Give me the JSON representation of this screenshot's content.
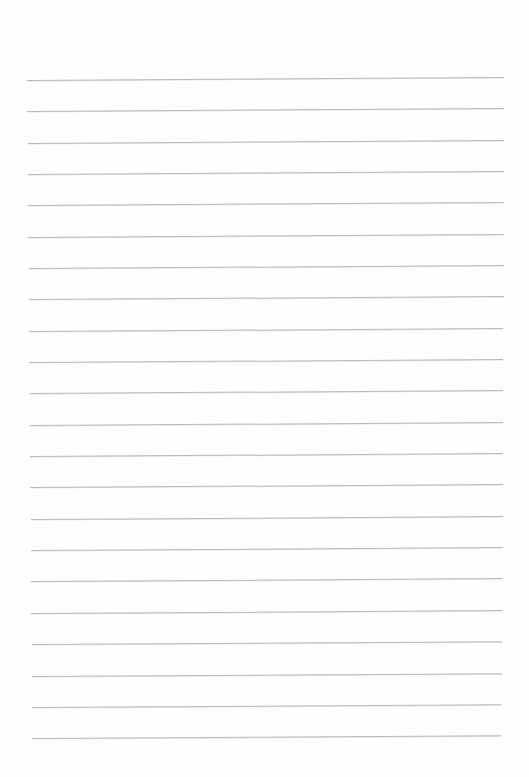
{
  "page": {
    "type": "lined-paper",
    "background_color": "#fefefe",
    "line_color": "#b9b9b9",
    "line_count": 22
  },
  "lines": [
    {
      "y": 80,
      "x1": 27,
      "x2": 504
    },
    {
      "y": 111,
      "x1": 27,
      "x2": 504
    },
    {
      "y": 143,
      "x1": 28,
      "x2": 504
    },
    {
      "y": 174,
      "x1": 28,
      "x2": 504
    },
    {
      "y": 205,
      "x1": 28,
      "x2": 504
    },
    {
      "y": 237,
      "x1": 28,
      "x2": 504
    },
    {
      "y": 268,
      "x1": 29,
      "x2": 504
    },
    {
      "y": 299,
      "x1": 29,
      "x2": 504
    },
    {
      "y": 331,
      "x1": 29,
      "x2": 503
    },
    {
      "y": 362,
      "x1": 29,
      "x2": 503
    },
    {
      "y": 393,
      "x1": 30,
      "x2": 503
    },
    {
      "y": 425,
      "x1": 30,
      "x2": 503
    },
    {
      "y": 456,
      "x1": 30,
      "x2": 503
    },
    {
      "y": 487,
      "x1": 30,
      "x2": 503
    },
    {
      "y": 519,
      "x1": 31,
      "x2": 503
    },
    {
      "y": 550,
      "x1": 31,
      "x2": 502
    },
    {
      "y": 581,
      "x1": 31,
      "x2": 502
    },
    {
      "y": 613,
      "x1": 31,
      "x2": 502
    },
    {
      "y": 644,
      "x1": 32,
      "x2": 502
    },
    {
      "y": 676,
      "x1": 32,
      "x2": 502
    },
    {
      "y": 707,
      "x1": 32,
      "x2": 501
    },
    {
      "y": 738,
      "x1": 32,
      "x2": 501
    }
  ]
}
